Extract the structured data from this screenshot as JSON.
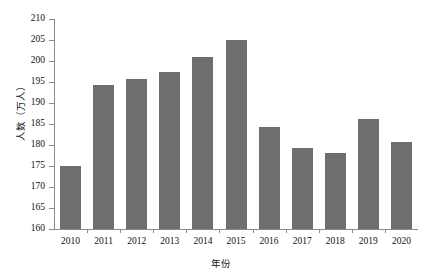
{
  "chart_data": {
    "type": "bar",
    "title": "",
    "xlabel": "年份",
    "ylabel": "人数（万人）",
    "categories": [
      "2010",
      "2011",
      "2012",
      "2013",
      "2014",
      "2015",
      "2016",
      "2017",
      "2018",
      "2019",
      "2020"
    ],
    "values": [
      175.0,
      194.4,
      195.6,
      197.5,
      200.9,
      205.0,
      184.4,
      179.3,
      178.2,
      186.3,
      180.7
    ],
    "ylim": [
      160,
      210
    ],
    "yticks": [
      160,
      165,
      170,
      175,
      180,
      185,
      190,
      195,
      200,
      205,
      210
    ],
    "ytick_labels": [
      "160",
      "165",
      "170",
      "175",
      "180",
      "185",
      "190",
      "195",
      "200",
      "205",
      "210"
    ],
    "grid": false,
    "legend": null,
    "series": [
      {
        "name": "人数",
        "color": "#6e6e6e",
        "values": [
          175.0,
          194.4,
          195.6,
          197.5,
          200.9,
          205.0,
          184.4,
          179.3,
          178.2,
          186.3,
          180.7
        ]
      }
    ]
  },
  "axes": {
    "y_title": "人数（万人）",
    "x_title": "年份"
  },
  "style": {
    "bar_color": "#6e6e6e",
    "axis_color": "#8a8a8a",
    "background": "#ffffff"
  }
}
